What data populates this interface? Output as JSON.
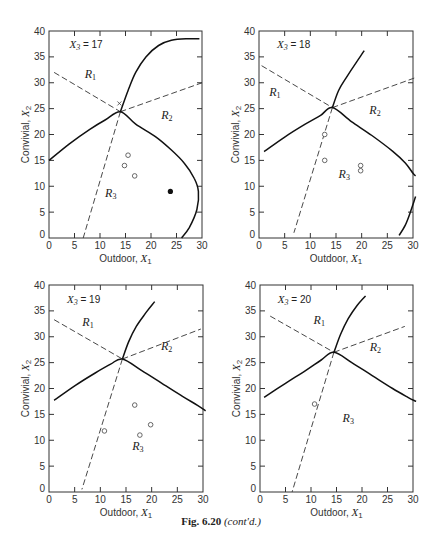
{
  "caption": {
    "fig": "Fig. 6.20",
    "note": "(cont'd.)"
  },
  "chart_data": [
    {
      "type": "line",
      "title": "X3 = 17",
      "xlabel": "Outdoor, X1",
      "ylabel": "Convivial, X2",
      "xlim": [
        0,
        30
      ],
      "ylim": [
        0,
        40
      ],
      "xticks": [
        0,
        5,
        10,
        15,
        20,
        25,
        30
      ],
      "yticks": [
        0,
        5,
        10,
        15,
        20,
        25,
        30,
        35,
        40
      ],
      "frame": {
        "x0": 49,
        "x1": 202,
        "y0": 238,
        "y1": 31
      },
      "title_pos": [
        4,
        37.5
      ],
      "regions": [
        {
          "label": "R1",
          "x": 7,
          "y": 31
        },
        {
          "label": "R2",
          "x": 22,
          "y": 23
        },
        {
          "label": "R3",
          "x": 11,
          "y": 8
        }
      ],
      "solid_curves": [
        [
          [
            0,
            15
          ],
          [
            4,
            18.2
          ],
          [
            8,
            21
          ],
          [
            11,
            22.8
          ],
          [
            14,
            24.4
          ],
          [
            17,
            22
          ],
          [
            21,
            19.5
          ],
          [
            24,
            17
          ],
          [
            26.5,
            14.5
          ],
          [
            28.5,
            11.5
          ],
          [
            29.3,
            9
          ],
          [
            29,
            5.5
          ],
          [
            27.5,
            2
          ],
          [
            26,
            0
          ]
        ],
        [
          [
            14,
            24.4
          ],
          [
            15.5,
            28.5
          ],
          [
            17,
            32
          ],
          [
            19,
            35
          ],
          [
            21.5,
            37.2
          ],
          [
            24,
            38.2
          ],
          [
            27,
            38.5
          ],
          [
            29.5,
            38.5
          ]
        ]
      ],
      "dashed_lines": [
        [
          [
            1,
            32
          ],
          [
            14,
            24.4
          ]
        ],
        [
          [
            14,
            24.4
          ],
          [
            30,
            30
          ]
        ],
        [
          [
            14,
            24.4
          ],
          [
            6.7,
            0
          ]
        ]
      ],
      "open_points": [
        [
          15.5,
          16
        ],
        [
          14.8,
          14
        ],
        [
          16.8,
          12
        ]
      ],
      "filled_points": [
        [
          23.8,
          9
        ]
      ],
      "cross_points": [
        [
          13.8,
          26
        ]
      ]
    },
    {
      "type": "line",
      "title": "X3 = 18",
      "xlabel": "Outdoor, X1",
      "ylabel": "Convivial, X2",
      "xlim": [
        0,
        30
      ],
      "ylim": [
        0,
        40
      ],
      "xticks": [
        0,
        5,
        10,
        15,
        20,
        25,
        30
      ],
      "yticks": [
        0,
        5,
        10,
        15,
        20,
        25,
        30,
        35,
        40
      ],
      "frame": {
        "x0": 259,
        "x1": 413,
        "y0": 238,
        "y1": 31
      },
      "title_pos": [
        3.5,
        37.5
      ],
      "regions": [
        {
          "label": "R1",
          "x": 2,
          "y": 27.5
        },
        {
          "label": "R2",
          "x": 21.5,
          "y": 24
        },
        {
          "label": "R3",
          "x": 15.5,
          "y": 11.5
        }
      ],
      "solid_curves": [
        [
          [
            1,
            16.7
          ],
          [
            5,
            19.5
          ],
          [
            9,
            22
          ],
          [
            12,
            23.7
          ],
          [
            14.3,
            25.2
          ],
          [
            18,
            22.5
          ],
          [
            22,
            19.8
          ],
          [
            26,
            16.8
          ],
          [
            28.5,
            14.5
          ],
          [
            30,
            12.5
          ],
          [
            30.5,
            12
          ]
        ],
        [
          [
            14.3,
            25.2
          ],
          [
            15.5,
            28.5
          ],
          [
            17,
            31
          ],
          [
            19,
            34
          ],
          [
            20.5,
            36.2
          ]
        ],
        [
          [
            27.3,
            0.5
          ],
          [
            28.5,
            2.5
          ],
          [
            29.5,
            5
          ],
          [
            30.5,
            8
          ]
        ]
      ],
      "dashed_lines": [
        [
          [
            0.5,
            33.3
          ],
          [
            14.3,
            25.2
          ]
        ],
        [
          [
            14.3,
            25.2
          ],
          [
            30.5,
            31
          ]
        ],
        [
          [
            14.3,
            25.2
          ],
          [
            6.8,
            1
          ]
        ]
      ],
      "open_points": [
        [
          12.8,
          20
        ],
        [
          12.8,
          15
        ],
        [
          19.8,
          14
        ],
        [
          19.8,
          13
        ]
      ],
      "filled_points": [],
      "cross_points": []
    },
    {
      "type": "line",
      "title": "X3 = 19",
      "xlabel": "Outdoor, X1",
      "ylabel": "Convivial, X2",
      "xlim": [
        0,
        30
      ],
      "ylim": [
        0,
        40
      ],
      "xticks": [
        0,
        5,
        10,
        15,
        20,
        25,
        30
      ],
      "yticks": [
        0,
        5,
        10,
        15,
        20,
        25,
        30,
        35,
        40
      ],
      "frame": {
        "x0": 49,
        "x1": 203,
        "y0": 492,
        "y1": 285
      },
      "title_pos": [
        3.5,
        37.3
      ],
      "regions": [
        {
          "label": "R1",
          "x": 6.5,
          "y": 32
        },
        {
          "label": "R2",
          "x": 21.8,
          "y": 27.5
        },
        {
          "label": "R3",
          "x": 16.2,
          "y": 8.2
        }
      ],
      "solid_curves": [
        [
          [
            1,
            17.7
          ],
          [
            5,
            20.5
          ],
          [
            9,
            23
          ],
          [
            12,
            24.7
          ],
          [
            14.3,
            25.7
          ],
          [
            18,
            23.5
          ],
          [
            22,
            21
          ],
          [
            26,
            18.5
          ],
          [
            29,
            16.7
          ],
          [
            30.5,
            15.7
          ]
        ],
        [
          [
            14.3,
            25.7
          ],
          [
            15.5,
            29
          ],
          [
            17,
            32
          ],
          [
            19,
            34.8
          ],
          [
            20.6,
            36.8
          ]
        ]
      ],
      "dashed_lines": [
        [
          [
            1,
            33.3
          ],
          [
            14.3,
            25.7
          ]
        ],
        [
          [
            14.3,
            25.7
          ],
          [
            29.6,
            31.5
          ]
        ],
        [
          [
            14.3,
            25.7
          ],
          [
            6.4,
            0.5
          ]
        ]
      ],
      "open_points": [
        [
          10.8,
          11.8
        ],
        [
          16.7,
          16.8
        ],
        [
          17.7,
          11
        ],
        [
          19.8,
          13
        ]
      ],
      "filled_points": [],
      "cross_points": []
    },
    {
      "type": "line",
      "title": "X3 = 20",
      "xlabel": "Outdoor, X1",
      "ylabel": "Convivial, X2",
      "xlim": [
        0,
        30
      ],
      "ylim": [
        0,
        40
      ],
      "xticks": [
        0,
        5,
        10,
        15,
        20,
        25,
        30
      ],
      "yticks": [
        0,
        5,
        10,
        15,
        20,
        25,
        30,
        35,
        40
      ],
      "frame": {
        "x0": 260,
        "x1": 413,
        "y0": 492,
        "y1": 285
      },
      "title_pos": [
        3.5,
        37.3
      ],
      "regions": [
        {
          "label": "R1",
          "x": 10.5,
          "y": 32.5
        },
        {
          "label": "R2",
          "x": 21.5,
          "y": 27.3
        },
        {
          "label": "R3",
          "x": 16.2,
          "y": 13.5
        }
      ],
      "solid_curves": [
        [
          [
            0.8,
            18.3
          ],
          [
            5,
            21
          ],
          [
            9,
            23.5
          ],
          [
            12,
            25.5
          ],
          [
            14.5,
            27
          ],
          [
            18,
            25
          ],
          [
            22,
            22.5
          ],
          [
            26,
            20
          ],
          [
            29,
            18.3
          ],
          [
            30.6,
            17.5
          ]
        ],
        [
          [
            14.5,
            27
          ],
          [
            15.8,
            30.5
          ],
          [
            17.3,
            33.5
          ],
          [
            19,
            36
          ],
          [
            20.7,
            37.9
          ]
        ]
      ],
      "dashed_lines": [
        [
          [
            2,
            34
          ],
          [
            14.5,
            27
          ]
        ],
        [
          [
            14.5,
            27
          ],
          [
            28.4,
            32
          ]
        ],
        [
          [
            14.5,
            27
          ],
          [
            6.3,
            0
          ]
        ]
      ],
      "open_points": [
        [
          10.7,
          17
        ]
      ],
      "filled_points": [],
      "cross_points": []
    }
  ],
  "plots": [
    {
      "title_var": "X",
      "title_sub": "3",
      "title_val": " = 17"
    },
    {
      "title_var": "X",
      "title_sub": "3",
      "title_val": " = 18"
    },
    {
      "title_var": "X",
      "title_sub": "3",
      "title_val": " = 19"
    },
    {
      "title_var": "X",
      "title_sub": "3",
      "title_val": " = 20"
    }
  ],
  "axes": {
    "xlabel_text": "Outdoor, ",
    "xlabel_var": "X",
    "xlabel_sub": "1",
    "ylabel_text": "Convivial, ",
    "ylabel_var": "X",
    "ylabel_sub": "2"
  }
}
